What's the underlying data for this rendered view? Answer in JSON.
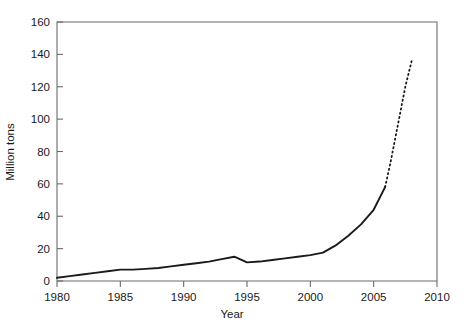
{
  "chart_data": {
    "type": "line",
    "title": "",
    "xlabel": "Year",
    "ylabel": "Million tons",
    "xlim": [
      1980,
      2010
    ],
    "ylim": [
      0,
      160
    ],
    "grid": false,
    "legend": null,
    "xticks": [
      1980,
      1985,
      1990,
      1995,
      2000,
      2005,
      2010
    ],
    "yticks": [
      0,
      20,
      40,
      60,
      80,
      100,
      120,
      140,
      160
    ],
    "xtick_labels": [
      "1980",
      "1985",
      "1990",
      "1995",
      "2000",
      "2005",
      "2010"
    ],
    "ytick_labels": [
      "0",
      "20",
      "40",
      "60",
      "80",
      "100",
      "120",
      "140",
      "160"
    ],
    "series": [
      {
        "name": "historical",
        "style": "solid",
        "color": "#1a1a1a",
        "x": [
          1980,
          1981,
          1982,
          1983,
          1984,
          1985,
          1986,
          1987,
          1988,
          1989,
          1990,
          1991,
          1992,
          1993,
          1994,
          1995,
          1996,
          1997,
          1998,
          1999,
          2000,
          2001,
          2002,
          2003,
          2004,
          2005,
          2005.9
        ],
        "values": [
          2,
          3,
          4,
          5,
          6,
          7,
          7,
          7.5,
          8,
          9,
          10,
          11,
          12,
          13.5,
          15,
          11.5,
          12,
          13,
          14,
          15,
          16,
          17.5,
          22,
          28,
          35,
          44,
          58
        ]
      },
      {
        "name": "projection",
        "style": "dashed",
        "color": "#1a1a1a",
        "x": [
          2005.9,
          2006.3,
          2006.7,
          2007.1,
          2007.5,
          2008.0
        ],
        "values": [
          58,
          72,
          88,
          104,
          120,
          136
        ]
      }
    ],
    "annotations": []
  }
}
